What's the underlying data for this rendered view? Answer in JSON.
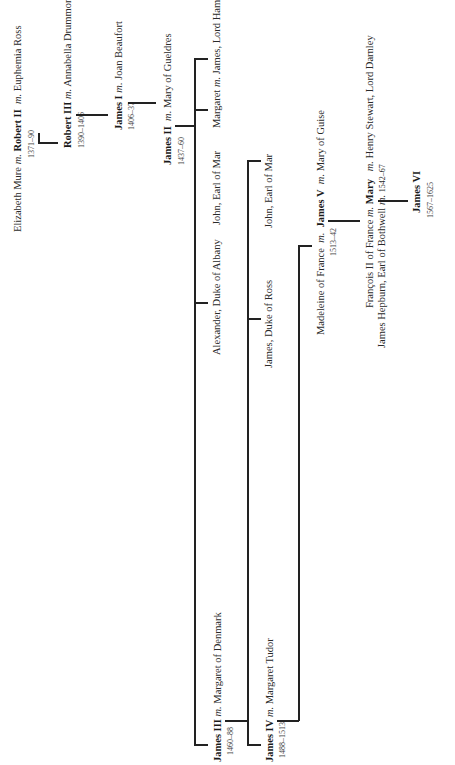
{
  "marriage_marker": "m.",
  "people": {
    "g1": {
      "left": "Elizabeth Mure",
      "main": "Robert II",
      "right": "Euphemia Ross",
      "dates": "1371–90"
    },
    "g2": {
      "main": "Robert III",
      "spouse": "Annabella Drummond",
      "dates": "1390–1406"
    },
    "g3": {
      "main": "James I",
      "spouse": "Joan Beaufort",
      "dates": "1406–37"
    },
    "g4": {
      "main": "James II",
      "spouse": "Mary of Gueldres",
      "dates": "1437–60"
    },
    "g4_children": [
      {
        "main": "James III",
        "spouse": "Margaret of Denmark",
        "dates": "1460–88"
      },
      {
        "name": "Alexander, Duke of Albany"
      },
      {
        "name": "John, Earl of Mar"
      },
      {
        "name": "Margaret",
        "spouse": "James, Lord Hamilton"
      }
    ],
    "g5_children": [
      {
        "main": "James IV",
        "spouse": "Margaret Tudor",
        "dates": "1488–1513"
      },
      {
        "name": "James, Duke of Ross"
      },
      {
        "name": "John, Earl of Mar"
      }
    ],
    "g6": {
      "left": "Madeleine of France",
      "main": "James V",
      "spouse": "Mary of Guise",
      "dates": "1513–42"
    },
    "g7": {
      "left1": "François II of France",
      "left2": "James Hepburn, Earl of Bothwell",
      "main": "Mary",
      "spouse": "Henry Stewart, Lord Darnley",
      "dates": "1542–67"
    },
    "g8": {
      "main": "James VI",
      "dates": "1567–1625"
    }
  }
}
